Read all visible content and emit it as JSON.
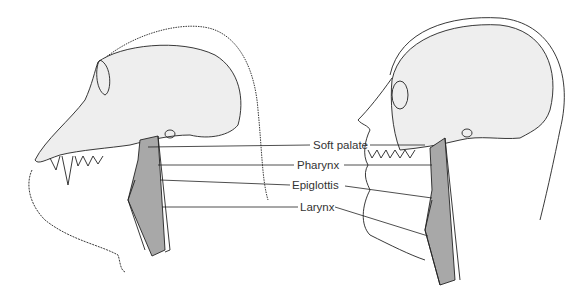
{
  "figure": {
    "subjects": [
      "chimpanzee",
      "human"
    ],
    "labels": [
      {
        "text": "Soft palate",
        "x": 313,
        "y": 138
      },
      {
        "text": "Pharynx",
        "x": 296,
        "y": 158
      },
      {
        "text": "Epiglottis",
        "x": 292,
        "y": 178
      },
      {
        "text": "Larynx",
        "x": 300,
        "y": 201
      }
    ],
    "colors": {
      "line": "#222222",
      "bone": "#eeeeee",
      "airway": "#a8a8a8"
    }
  }
}
